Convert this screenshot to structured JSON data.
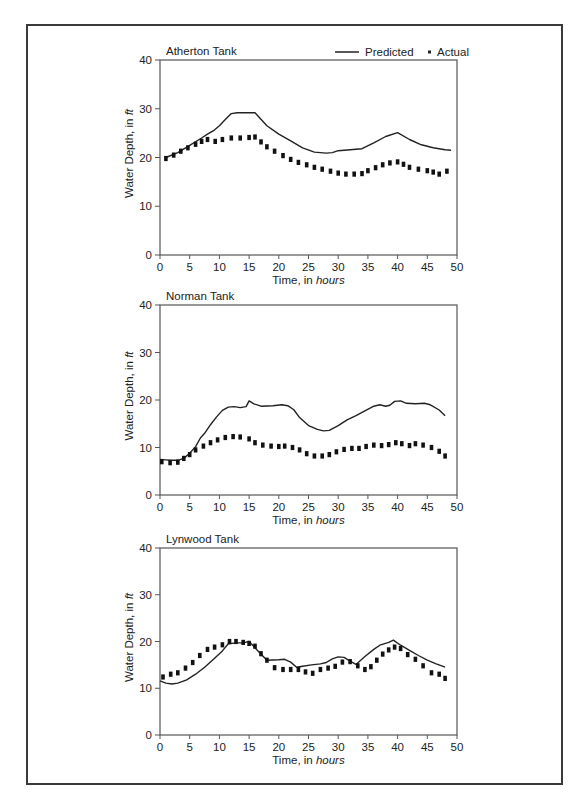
{
  "figure": {
    "legend": {
      "predicted_label": "Predicted",
      "actual_label": "Actual",
      "predicted_style": "solid line",
      "actual_style": "dotted squares"
    },
    "xlabel_prefix": "Time, in ",
    "xlabel_unit": "hours",
    "ylabel_prefix": "Water Depth, in ",
    "ylabel_unit": "ft"
  },
  "chart_data": [
    {
      "type": "line",
      "title": "Atherton Tank",
      "xlabel": "Time, in hours",
      "ylabel": "Water Depth, in ft",
      "xlim": [
        0,
        50
      ],
      "ylim": [
        0,
        40
      ],
      "xticks": [
        0,
        5,
        10,
        15,
        20,
        25,
        30,
        35,
        40,
        45,
        50
      ],
      "yticks": [
        0,
        10,
        20,
        30,
        40
      ],
      "grid": false,
      "legend_position": "top-right",
      "series": [
        {
          "name": "Predicted",
          "x": [
            1,
            3,
            5,
            7,
            8,
            9,
            10,
            11,
            12,
            13,
            14,
            15,
            16,
            18,
            20,
            22,
            24,
            26,
            28,
            29,
            30,
            32,
            34,
            36,
            38,
            40,
            42,
            44,
            46,
            48,
            49
          ],
          "values": [
            20,
            21,
            22.5,
            24,
            24.8,
            25.5,
            26.5,
            27.8,
            29,
            29.2,
            29.2,
            29.2,
            29.2,
            26.5,
            24.8,
            23.4,
            22,
            21.1,
            20.9,
            21,
            21.4,
            21.6,
            21.8,
            23,
            24.3,
            25.1,
            23.7,
            22.6,
            22,
            21.6,
            21.5
          ]
        },
        {
          "name": "Actual",
          "x": [
            1,
            2.3,
            3.5,
            4.7,
            6,
            7,
            8,
            9.3,
            10.5,
            12,
            13.5,
            15,
            16,
            17,
            18,
            19.3,
            20.7,
            22,
            23.3,
            24.7,
            26,
            27.3,
            28.7,
            30,
            31.3,
            32.7,
            34,
            35,
            36.3,
            37.5,
            38.7,
            40,
            41,
            42,
            43.5,
            45,
            46,
            47,
            48.3
          ],
          "values": [
            19.8,
            20.5,
            21.3,
            22,
            22.7,
            23.3,
            23.7,
            23.3,
            23.7,
            24,
            24,
            24.1,
            24.2,
            23.2,
            22.2,
            21.3,
            20.4,
            19.6,
            19,
            18.5,
            18,
            17.6,
            17.2,
            16.8,
            16.6,
            16.6,
            16.7,
            17.3,
            17.9,
            18.5,
            18.9,
            19.1,
            18.6,
            18,
            17.6,
            17.3,
            17,
            16.6,
            17.2
          ]
        }
      ]
    },
    {
      "type": "line",
      "title": "Norman Tank",
      "xlabel": "Time, in hours",
      "ylabel": "Water Depth, in ft",
      "xlim": [
        0,
        50
      ],
      "ylim": [
        0,
        40
      ],
      "xticks": [
        0,
        5,
        10,
        15,
        20,
        25,
        30,
        35,
        40,
        45,
        50
      ],
      "yticks": [
        0,
        10,
        20,
        30,
        40
      ],
      "grid": false,
      "series": [
        {
          "name": "Predicted",
          "x": [
            0,
            1,
            2,
            3,
            4,
            5,
            6,
            6.8,
            7.5,
            8.5,
            9.5,
            10.5,
            11.5,
            12.5,
            13.5,
            14.5,
            15,
            15.8,
            17,
            19,
            20.5,
            21.5,
            22.5,
            23.5,
            25,
            26.5,
            27.5,
            28.5,
            30,
            31.5,
            33,
            34.5,
            36,
            37,
            38,
            38.7,
            39.5,
            40.5,
            41.5,
            43,
            44.5,
            45.5,
            47,
            48
          ],
          "values": [
            7.5,
            7.4,
            7.3,
            7.3,
            7.7,
            8.8,
            10.2,
            12,
            13,
            14.8,
            16.4,
            17.8,
            18.5,
            18.6,
            18.4,
            18.6,
            19.8,
            19.2,
            18.7,
            18.8,
            19,
            18.8,
            18,
            16.3,
            14.6,
            13.8,
            13.5,
            13.6,
            14.6,
            15.8,
            16.7,
            17.7,
            18.7,
            19,
            18.7,
            18.9,
            19.7,
            19.8,
            19.3,
            19.2,
            19.3,
            19,
            17.9,
            16.7
          ]
        },
        {
          "name": "Actual",
          "x": [
            0.3,
            1.7,
            3,
            4,
            5,
            6,
            7.3,
            8.5,
            9.7,
            11,
            12.3,
            13.5,
            15,
            16,
            17.3,
            18.7,
            20,
            21,
            22.3,
            23.5,
            24.7,
            26,
            27.3,
            28.5,
            29.7,
            31,
            32.3,
            33.5,
            34.7,
            36,
            37.3,
            38.5,
            39.7,
            40.7,
            42,
            43,
            44.3,
            45.7,
            47,
            48
          ],
          "values": [
            7,
            6.8,
            6.9,
            7.7,
            8.5,
            9.5,
            10.3,
            11,
            11.6,
            12.1,
            12.3,
            12.2,
            11.8,
            11,
            10.5,
            10.3,
            10.2,
            10.3,
            10,
            9.5,
            8.7,
            8.2,
            8.2,
            8.5,
            9.1,
            9.6,
            9.8,
            9.8,
            10.2,
            10.5,
            10.4,
            10.6,
            11,
            10.8,
            10.4,
            10.8,
            10.5,
            10,
            9.2,
            8.2
          ]
        }
      ]
    },
    {
      "type": "line",
      "title": "Lynwood Tank",
      "xlabel": "Time, in hours",
      "ylabel": "Water Depth, in ft",
      "xlim": [
        0,
        50
      ],
      "ylim": [
        0,
        40
      ],
      "xticks": [
        0,
        5,
        10,
        15,
        20,
        25,
        30,
        35,
        40,
        45,
        50
      ],
      "yticks": [
        0,
        10,
        20,
        30,
        40
      ],
      "grid": false,
      "series": [
        {
          "name": "Predicted",
          "x": [
            0,
            1,
            2,
            3,
            4.5,
            6,
            7.5,
            9,
            10.5,
            11.5,
            13,
            14,
            15,
            16.5,
            18,
            20,
            21,
            22,
            23,
            24,
            25.5,
            27,
            28,
            29,
            30,
            31,
            32,
            33,
            34.5,
            36,
            37,
            38.5,
            39.3,
            40.5,
            42,
            43.5,
            45,
            46.5,
            48
          ],
          "values": [
            11.6,
            11.1,
            10.9,
            11.1,
            11.8,
            13,
            14.5,
            16.2,
            18,
            19.5,
            19.7,
            19.7,
            20,
            18,
            16,
            16.1,
            16.2,
            15.6,
            14.5,
            14.7,
            15,
            15.2,
            15.5,
            16.3,
            16.7,
            16.6,
            15.8,
            15.1,
            16.8,
            18.3,
            19.2,
            19.8,
            20.3,
            19.2,
            18.1,
            17,
            16,
            15.2,
            14.5
          ]
        },
        {
          "name": "Actual",
          "x": [
            0.5,
            1.8,
            3,
            4.3,
            5.5,
            6.7,
            8,
            9.2,
            10.5,
            11.7,
            12.8,
            14,
            15,
            16,
            17,
            18,
            19.3,
            20.7,
            22,
            23.3,
            24.5,
            25.7,
            27,
            28.3,
            29.5,
            30.7,
            32,
            33.3,
            34.5,
            35.5,
            36.5,
            37.5,
            38.5,
            39.5,
            40.5,
            41.7,
            43,
            44.3,
            45.7,
            47,
            48
          ],
          "values": [
            12.4,
            13,
            13.3,
            14.3,
            15.5,
            17,
            18.3,
            18.8,
            19.3,
            20,
            20,
            19.8,
            19.6,
            19,
            17.4,
            16,
            14.4,
            14,
            14,
            14,
            13.5,
            13.2,
            14,
            14.3,
            14.7,
            15.6,
            15.7,
            14.8,
            14,
            14.6,
            16,
            17.3,
            18.2,
            18.8,
            18.5,
            17.2,
            16.2,
            14.8,
            13.3,
            13,
            12.1
          ]
        }
      ]
    }
  ]
}
